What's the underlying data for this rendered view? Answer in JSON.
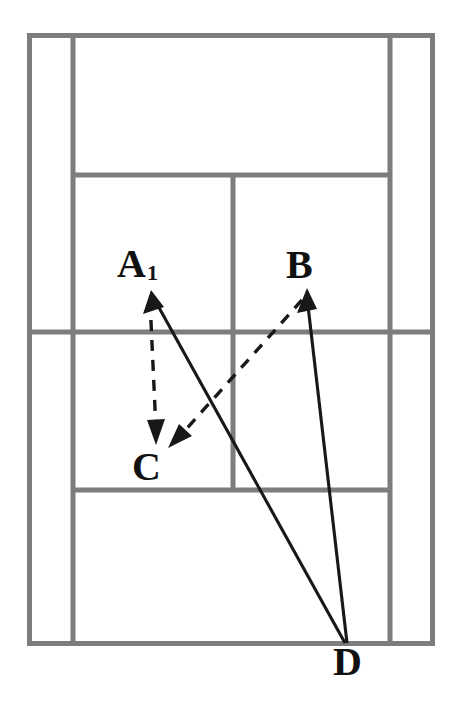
{
  "diagram": {
    "background_color": "#ffffff",
    "line_color": "#7d7d7d",
    "path_color": "#181818",
    "width": 459,
    "height": 707
  },
  "court": {
    "name": "tennis-court-plan-view",
    "outer_boundary": {
      "x1": 27,
      "y1": 33,
      "x2": 435,
      "y2": 646
    },
    "lines": [
      {
        "name": "left-doubles-alley-line",
        "orientation": "vertical",
        "x1": 73,
        "y1": 33,
        "x2": 73,
        "y2": 646
      },
      {
        "name": "right-doubles-alley-line",
        "orientation": "vertical",
        "x1": 390,
        "y1": 33,
        "x2": 390,
        "y2": 646
      },
      {
        "name": "top-service-line",
        "orientation": "horizontal",
        "x1": 73,
        "y1": 175,
        "x2": 390,
        "y2": 175
      },
      {
        "name": "net-line",
        "orientation": "horizontal",
        "x1": 27,
        "y1": 332,
        "x2": 435,
        "y2": 332
      },
      {
        "name": "bottom-service-line",
        "orientation": "horizontal",
        "x1": 73,
        "y1": 490,
        "x2": 390,
        "y2": 490
      },
      {
        "name": "center-service-line",
        "orientation": "vertical",
        "x1": 233,
        "y1": 175,
        "x2": 233,
        "y2": 490
      }
    ]
  },
  "labels": [
    {
      "id": "a1",
      "text": "A",
      "subscript": "1",
      "x": 117,
      "y": 244
    },
    {
      "id": "b",
      "text": "B",
      "subscript": "",
      "x": 286,
      "y": 245
    },
    {
      "id": "c",
      "text": "C",
      "subscript": "",
      "x": 132,
      "y": 447
    },
    {
      "id": "d",
      "text": "D",
      "subscript": "",
      "x": 333,
      "y": 642
    }
  ],
  "paths": [
    {
      "name": "path-d-to-a1",
      "style": "solid",
      "from": "D",
      "to": "A1",
      "d": "M 345 643 L 152 295",
      "arrow_at": "to",
      "arrow_points": "152,291 144,312 163,309"
    },
    {
      "name": "path-d-to-b",
      "style": "solid",
      "from": "D",
      "to": "B",
      "d": "M 347 643 L 307 295",
      "arrow_at": "to",
      "arrow_points": "307,289 298,312 316,310"
    },
    {
      "name": "path-a1-to-c",
      "style": "dashed",
      "from": "A1",
      "to": "C",
      "d": "M 150 300 L 155 432",
      "arrow_at": "to",
      "arrow_points": "155,443 147,421 164,421"
    },
    {
      "name": "path-b-to-c",
      "style": "dashed",
      "from": "B",
      "to": "C",
      "d": "M 302 300 L 178 438",
      "arrow_at": "to",
      "arrow_points": "170,447 180,425 191,438"
    }
  ]
}
